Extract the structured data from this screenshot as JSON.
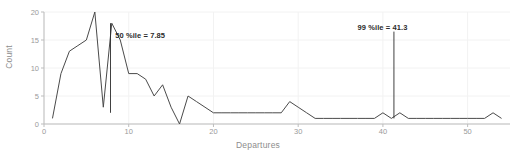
{
  "chart_data": {
    "type": "line",
    "title": "",
    "xlabel": "Departures",
    "ylabel": "Count",
    "xlim": [
      0,
      55
    ],
    "ylim": [
      0,
      20
    ],
    "xticks": [
      0,
      10,
      20,
      30,
      40,
      50
    ],
    "yticks": [
      0,
      5,
      10,
      15,
      20
    ],
    "grid": true,
    "legend": null,
    "line_color": "#4a4a4a",
    "annotation_color": "#2b2b2b",
    "series": [
      {
        "name": "Count",
        "x": [
          1,
          2,
          3,
          4,
          5,
          6,
          7,
          8,
          9,
          10,
          11,
          12,
          13,
          14,
          15,
          16,
          17,
          18,
          19,
          20,
          21,
          22,
          23,
          24,
          25,
          26,
          27,
          28,
          29,
          30,
          31,
          32,
          33,
          34,
          35,
          36,
          37,
          38,
          39,
          40,
          41,
          42,
          43,
          44,
          45,
          46,
          47,
          48,
          49,
          50,
          51,
          52,
          53,
          54
        ],
        "values": [
          1,
          9,
          13,
          14,
          15,
          20,
          3,
          18,
          15,
          9,
          9,
          8,
          5,
          7,
          3,
          0,
          5,
          4,
          3,
          2,
          2,
          2,
          2,
          2,
          2,
          2,
          2,
          2,
          4,
          3,
          2,
          1,
          1,
          1,
          1,
          1,
          1,
          1,
          1,
          2,
          1,
          2,
          1,
          1,
          1,
          1,
          1,
          1,
          1,
          1,
          1,
          1,
          2,
          1
        ]
      }
    ],
    "annotations": [
      {
        "id": "p50",
        "label": "50 %ile = 7.85",
        "x": 7.85,
        "marker": "vertical-line",
        "line_top_value": 18,
        "line_bottom_value": 2,
        "text_x": 8.4,
        "text_y_value": 15.8
      },
      {
        "id": "p99",
        "label": "99 %ile = 41.3",
        "x": 41.3,
        "marker": "vertical-line",
        "line_top_value": 16.5,
        "line_bottom_value": 1,
        "text_x": 37.0,
        "text_y_value": 17.2
      }
    ]
  }
}
